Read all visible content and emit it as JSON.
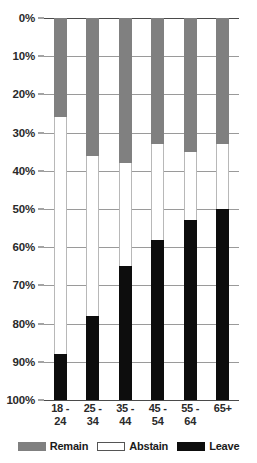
{
  "chart_data": {
    "type": "bar",
    "subtype": "stacked-100",
    "orientation": "vertical",
    "title": "",
    "subtitle": "",
    "xlabel": "",
    "ylabel": "",
    "ylim": [
      0,
      100
    ],
    "y_inverted": true,
    "grid": true,
    "legend_position": "bottom",
    "categories": [
      "18 - 24",
      "25 - 34",
      "35 - 44",
      "45 - 54",
      "55 - 64",
      "65+"
    ],
    "category_lines": [
      [
        "18 -",
        "24"
      ],
      [
        "25 -",
        "34"
      ],
      [
        "35 -",
        "44"
      ],
      [
        "45 -",
        "54"
      ],
      [
        "55 -",
        "64"
      ],
      [
        "65+",
        ""
      ]
    ],
    "ytick_labels": [
      "0%",
      "10%",
      "20%",
      "30%",
      "40%",
      "50%",
      "60%",
      "70%",
      "80%",
      "90%",
      "100%"
    ],
    "ytick_values": [
      0,
      10,
      20,
      30,
      40,
      50,
      60,
      70,
      80,
      90,
      100
    ],
    "series": [
      {
        "name": "Remain",
        "color": "#808080",
        "values": [
          26,
          36,
          38,
          33,
          35,
          33
        ]
      },
      {
        "name": "Abstain",
        "color": "#ffffff",
        "values": [
          62,
          42,
          27,
          25,
          18,
          17
        ]
      },
      {
        "name": "Leave",
        "color": "#0d0d0d",
        "values": [
          12,
          22,
          35,
          42,
          47,
          50
        ]
      }
    ]
  },
  "legend": {
    "items": [
      {
        "label": "Remain",
        "swatch": "remain-swatch"
      },
      {
        "label": "Abstain",
        "swatch": "abstain-swatch"
      },
      {
        "label": "Leave",
        "swatch": "leave-swatch"
      }
    ]
  }
}
